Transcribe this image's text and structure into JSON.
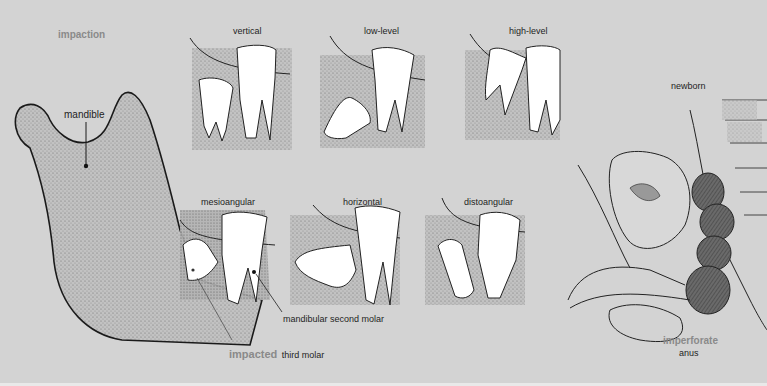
{
  "figure": {
    "sections": {
      "impaction": {
        "title": "impaction",
        "mandible_label": "mandible",
        "types": [
          {
            "label": "vertical"
          },
          {
            "label": "low-level"
          },
          {
            "label": "high-level"
          },
          {
            "label": "mesioangular"
          },
          {
            "label": "horizontal"
          },
          {
            "label": "distoangular"
          }
        ],
        "callouts": {
          "second_molar": "mandibular second molar",
          "third_molar_prefix": "impacted",
          "third_molar_suffix": "third molar"
        }
      },
      "newborn": {
        "title": "newborn",
        "caption_highlight": "imperforate",
        "caption_rest": "anus"
      }
    },
    "colors": {
      "background": "#d3d3d3",
      "highlight_text": "#8a8a8a",
      "text": "#1e1e1e",
      "tooth": "#ffffff",
      "bone_stipple": "#9a9a9a",
      "meconium": "#5a5a5a"
    }
  }
}
